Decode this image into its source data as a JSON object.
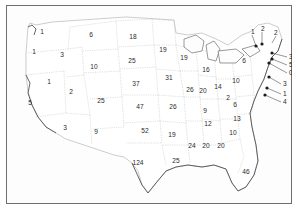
{
  "map": {
    "title": "United States choropleth-style map with per-state counts",
    "frame_color": "#6e6e6e",
    "land_color": "#ffffff",
    "border_color": "#9a9a9a",
    "coast_color": "#4a4a4a",
    "label_color": "#2a2a2a"
  },
  "chart_data": {
    "type": "map",
    "title": "",
    "unit": "count",
    "states": [
      {
        "code": "WA",
        "name": "Washington",
        "value": 1,
        "x": 36,
        "y": 27
      },
      {
        "code": "OR",
        "name": "Oregon",
        "value": 1,
        "x": 28,
        "y": 47
      },
      {
        "code": "CA",
        "name": "California",
        "value": 5,
        "x": 24,
        "y": 98
      },
      {
        "code": "ID",
        "name": "Idaho",
        "value": 3,
        "x": 56,
        "y": 50
      },
      {
        "code": "NV",
        "name": "Nevada",
        "value": 1,
        "x": 43,
        "y": 77
      },
      {
        "code": "UT",
        "name": "Utah",
        "value": 2,
        "x": 65,
        "y": 87
      },
      {
        "code": "AZ",
        "name": "Arizona",
        "value": 3,
        "x": 59,
        "y": 123
      },
      {
        "code": "MT",
        "name": "Montana",
        "value": 6,
        "x": 85,
        "y": 30
      },
      {
        "code": "WY",
        "name": "Wyoming",
        "value": 10,
        "x": 88,
        "y": 62
      },
      {
        "code": "CO",
        "name": "Colorado",
        "value": 25,
        "x": 95,
        "y": 96
      },
      {
        "code": "NM",
        "name": "New Mexico",
        "value": 9,
        "x": 90,
        "y": 127
      },
      {
        "code": "ND",
        "name": "North Dakota",
        "value": 18,
        "x": 127,
        "y": 32
      },
      {
        "code": "SD",
        "name": "South Dakota",
        "value": 25,
        "x": 126,
        "y": 56
      },
      {
        "code": "NE",
        "name": "Nebraska",
        "value": 37,
        "x": 130,
        "y": 79
      },
      {
        "code": "KS",
        "name": "Kansas",
        "value": 47,
        "x": 134,
        "y": 102
      },
      {
        "code": "OK",
        "name": "Oklahoma",
        "value": 52,
        "x": 139,
        "y": 126
      },
      {
        "code": "TX",
        "name": "Texas",
        "value": 124,
        "x": 132,
        "y": 158
      },
      {
        "code": "MN",
        "name": "Minnesota",
        "value": 19,
        "x": 157,
        "y": 45
      },
      {
        "code": "IA",
        "name": "Iowa",
        "value": 31,
        "x": 163,
        "y": 73
      },
      {
        "code": "MO",
        "name": "Missouri",
        "value": 26,
        "x": 167,
        "y": 102
      },
      {
        "code": "AR",
        "name": "Arkansas",
        "value": 19,
        "x": 166,
        "y": 130
      },
      {
        "code": "LA",
        "name": "Louisiana",
        "value": 25,
        "x": 170,
        "y": 156
      },
      {
        "code": "WI",
        "name": "Wisconsin",
        "value": 19,
        "x": 178,
        "y": 53
      },
      {
        "code": "IL",
        "name": "Illinois",
        "value": 26,
        "x": 184,
        "y": 85
      },
      {
        "code": "MS",
        "name": "Mississippi",
        "value": 24,
        "x": 186,
        "y": 141
      },
      {
        "code": "MI",
        "name": "Michigan",
        "value": 16,
        "x": 200,
        "y": 65
      },
      {
        "code": "IN",
        "name": "Indiana",
        "value": 20,
        "x": 197,
        "y": 86
      },
      {
        "code": "KY",
        "name": "Kentucky",
        "value": 9,
        "x": 199,
        "y": 106
      },
      {
        "code": "TN",
        "name": "Tennessee",
        "value": 12,
        "x": 202,
        "y": 119
      },
      {
        "code": "AL",
        "name": "Alabama",
        "value": 20,
        "x": 200,
        "y": 141
      },
      {
        "code": "OH",
        "name": "Ohio",
        "value": 14,
        "x": 212,
        "y": 82
      },
      {
        "code": "GA",
        "name": "Georgia",
        "value": 20,
        "x": 215,
        "y": 141
      },
      {
        "code": "WV",
        "name": "West Virginia",
        "value": 2,
        "x": 222,
        "y": 93
      },
      {
        "code": "SC",
        "name": "South Carolina",
        "value": 10,
        "x": 227,
        "y": 128
      },
      {
        "code": "NC",
        "name": "North Carolina",
        "value": 13,
        "x": 231,
        "y": 114
      },
      {
        "code": "VA",
        "name": "Virginia",
        "value": 6,
        "x": 229,
        "y": 100
      },
      {
        "code": "PA",
        "name": "Pennsylvania",
        "value": 10,
        "x": 230,
        "y": 76
      },
      {
        "code": "NY",
        "name": "New York",
        "value": 6,
        "x": 238,
        "y": 56
      },
      {
        "code": "FL",
        "name": "Florida",
        "value": 46,
        "x": 240,
        "y": 167
      }
    ],
    "callouts": [
      {
        "code": "VT",
        "name": "Vermont",
        "value": 1,
        "label_x": 245,
        "label_y": 27,
        "dot_x": 250,
        "dot_y": 41
      },
      {
        "code": "NH",
        "name": "New Hampshire",
        "value": 2,
        "label_x": 255,
        "label_y": 24,
        "dot_x": 256,
        "dot_y": 39
      },
      {
        "code": "ME",
        "name": "Maine",
        "value": 2,
        "label_x": 268,
        "label_y": 28,
        "dot_x": 268,
        "dot_y": 28
      },
      {
        "code": "MA",
        "name": "Massachusetts",
        "value": 3,
        "label_x": 283,
        "label_y": 52,
        "dot_x": 266,
        "dot_y": 48
      },
      {
        "code": "RI",
        "name": "Rhode Island",
        "value": 5,
        "label_x": 283,
        "label_y": 60,
        "dot_x": 266,
        "dot_y": 54
      },
      {
        "code": "CT",
        "name": "Connecticut",
        "value": 0,
        "label_x": 283,
        "label_y": 68,
        "dot_x": 263,
        "dot_y": 58
      },
      {
        "code": "NJ",
        "name": "New Jersey",
        "value": 3,
        "label_x": 277,
        "label_y": 79,
        "dot_x": 263,
        "dot_y": 72
      },
      {
        "code": "DE",
        "name": "Delaware",
        "value": 1,
        "label_x": 277,
        "label_y": 89,
        "dot_x": 261,
        "dot_y": 83
      },
      {
        "code": "MD",
        "name": "Maryland",
        "value": 4,
        "label_x": 277,
        "label_y": 97,
        "dot_x": 259,
        "dot_y": 90
      }
    ]
  }
}
